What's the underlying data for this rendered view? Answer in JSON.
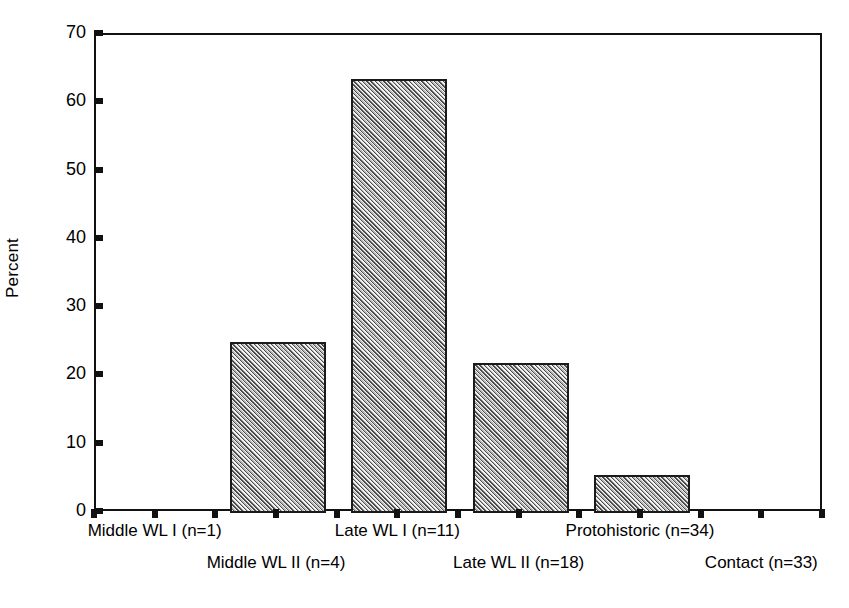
{
  "chart_data": {
    "type": "bar",
    "title": "",
    "subtitle": "",
    "xlabel": "",
    "ylabel": "Percent",
    "ylim": [
      0,
      70
    ],
    "yticks": [
      0,
      10,
      20,
      30,
      40,
      50,
      60,
      70
    ],
    "ytick_labels": [
      "0",
      "10",
      "20",
      "30",
      "40",
      "50",
      "60",
      "70"
    ],
    "grid": false,
    "legend": null,
    "bar_fill": "#b9b9b9",
    "bar_edge": "#1a1a1a",
    "bar_hatch": "diagonal-hatch",
    "axis_color": "#111111",
    "categories": [
      "Middle WL I (n=1)",
      "Middle WL II (n=4)",
      "Late WL I (n=11)",
      "Late WL II (n=18)",
      "Protohistoric (n=34)",
      "Contact (n=33)"
    ],
    "category_counts": [
      1,
      4,
      11,
      18,
      34,
      33
    ],
    "values": [
      0,
      25,
      63.5,
      22,
      5.6,
      0
    ],
    "value_labels": [
      "0",
      "25",
      "63.5",
      "22",
      "5.6",
      "0"
    ]
  },
  "axes": {
    "y": {
      "title": "Percent",
      "ticks": [
        {
          "value": 70,
          "label": "70"
        },
        {
          "value": 60,
          "label": "60"
        },
        {
          "value": 50,
          "label": "50"
        },
        {
          "value": 40,
          "label": "40"
        },
        {
          "value": 30,
          "label": "30"
        },
        {
          "value": 20,
          "label": "20"
        },
        {
          "value": 10,
          "label": "10"
        },
        {
          "value": 0,
          "label": "0"
        }
      ]
    },
    "x": {
      "labels": [
        {
          "text": "Middle WL I (n=1)",
          "row": "top"
        },
        {
          "text": "Middle WL II (n=4)",
          "row": "bottom"
        },
        {
          "text": "Late WL I (n=11)",
          "row": "top"
        },
        {
          "text": "Late WL II (n=18)",
          "row": "bottom"
        },
        {
          "text": "Protohistoric (n=34)",
          "row": "top"
        },
        {
          "text": "Contact (n=33)",
          "row": "bottom"
        }
      ]
    }
  }
}
